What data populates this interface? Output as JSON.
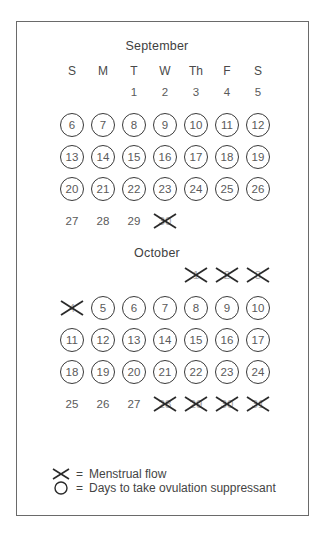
{
  "layout": {
    "columns_x": [
      72,
      103,
      134,
      165,
      196,
      227,
      258
    ]
  },
  "weekday_headers": [
    "S",
    "M",
    "T",
    "W",
    "Th",
    "F",
    "S"
  ],
  "months": [
    {
      "name": "September",
      "title_y": 47,
      "header_y": 71,
      "rows": [
        {
          "y": 92,
          "cells": [
            null,
            null,
            {
              "d": "1",
              "m": "none"
            },
            {
              "d": "2",
              "m": "none"
            },
            {
              "d": "3",
              "m": "none"
            },
            {
              "d": "4",
              "m": "none"
            },
            {
              "d": "5",
              "m": "none"
            }
          ]
        },
        {
          "y": 125,
          "cells": [
            {
              "d": "6",
              "m": "circle"
            },
            {
              "d": "7",
              "m": "circle"
            },
            {
              "d": "8",
              "m": "circle"
            },
            {
              "d": "9",
              "m": "circle"
            },
            {
              "d": "10",
              "m": "circle"
            },
            {
              "d": "11",
              "m": "circle"
            },
            {
              "d": "12",
              "m": "circle"
            }
          ]
        },
        {
          "y": 157,
          "cells": [
            {
              "d": "13",
              "m": "circle"
            },
            {
              "d": "14",
              "m": "circle"
            },
            {
              "d": "15",
              "m": "circle"
            },
            {
              "d": "16",
              "m": "circle"
            },
            {
              "d": "17",
              "m": "circle"
            },
            {
              "d": "18",
              "m": "circle"
            },
            {
              "d": "19",
              "m": "circle"
            }
          ]
        },
        {
          "y": 189,
          "cells": [
            {
              "d": "20",
              "m": "circle"
            },
            {
              "d": "21",
              "m": "circle"
            },
            {
              "d": "22",
              "m": "circle"
            },
            {
              "d": "23",
              "m": "circle"
            },
            {
              "d": "24",
              "m": "circle"
            },
            {
              "d": "25",
              "m": "circle"
            },
            {
              "d": "26",
              "m": "circle"
            }
          ]
        },
        {
          "y": 221,
          "cells": [
            {
              "d": "27",
              "m": "none"
            },
            {
              "d": "28",
              "m": "none"
            },
            {
              "d": "29",
              "m": "none"
            },
            {
              "d": "30",
              "m": "cross"
            },
            null,
            null,
            null
          ]
        }
      ]
    },
    {
      "name": "October",
      "title_y": 254,
      "header_y": null,
      "rows": [
        {
          "y": 275,
          "cells": [
            null,
            null,
            null,
            null,
            {
              "d": "1",
              "m": "cross"
            },
            {
              "d": "2",
              "m": "cross"
            },
            {
              "d": "3",
              "m": "cross"
            }
          ]
        },
        {
          "y": 308,
          "cells": [
            {
              "d": "4",
              "m": "cross"
            },
            {
              "d": "5",
              "m": "circle"
            },
            {
              "d": "6",
              "m": "circle"
            },
            {
              "d": "7",
              "m": "circle"
            },
            {
              "d": "8",
              "m": "circle"
            },
            {
              "d": "9",
              "m": "circle"
            },
            {
              "d": "10",
              "m": "circle"
            }
          ]
        },
        {
          "y": 340,
          "cells": [
            {
              "d": "11",
              "m": "circle"
            },
            {
              "d": "12",
              "m": "circle"
            },
            {
              "d": "13",
              "m": "circle"
            },
            {
              "d": "14",
              "m": "circle"
            },
            {
              "d": "15",
              "m": "circle"
            },
            {
              "d": "16",
              "m": "circle"
            },
            {
              "d": "17",
              "m": "circle"
            }
          ]
        },
        {
          "y": 372,
          "cells": [
            {
              "d": "18",
              "m": "circle"
            },
            {
              "d": "19",
              "m": "circle"
            },
            {
              "d": "20",
              "m": "circle"
            },
            {
              "d": "21",
              "m": "circle"
            },
            {
              "d": "22",
              "m": "circle"
            },
            {
              "d": "23",
              "m": "circle"
            },
            {
              "d": "24",
              "m": "circle"
            }
          ]
        },
        {
          "y": 404,
          "cells": [
            {
              "d": "25",
              "m": "none"
            },
            {
              "d": "26",
              "m": "none"
            },
            {
              "d": "27",
              "m": "none"
            },
            {
              "d": "28",
              "m": "cross"
            },
            {
              "d": "29",
              "m": "cross"
            },
            {
              "d": "30",
              "m": "cross"
            },
            {
              "d": "31",
              "m": "cross"
            }
          ]
        }
      ]
    }
  ],
  "legend": {
    "items": [
      {
        "icon": "cross-icon",
        "equals": "=",
        "label": "Menstrual flow"
      },
      {
        "icon": "circle-icon",
        "equals": "=",
        "label": "Days to take ovulation suppressant"
      }
    ]
  },
  "colors": {
    "frame": "#6a6a6a",
    "text": "#5a5a5a",
    "circle_stroke": "#3a3a3a",
    "cross_stroke": "#2a2a2a"
  }
}
